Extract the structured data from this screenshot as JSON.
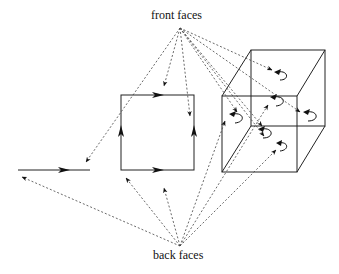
{
  "diagram": {
    "labels": {
      "front": "front faces",
      "back": "back faces"
    },
    "colors": {
      "line": "#222222",
      "dashed": "#444444",
      "background": "#ffffff"
    },
    "shapes": {
      "segment": {
        "x1": 18,
        "y1": 170,
        "x2": 90,
        "y2": 170
      },
      "square": {
        "x": 121,
        "y": 95,
        "w": 73,
        "h": 75
      },
      "cube": {
        "front": {
          "x": 222,
          "y": 96,
          "w": 75,
          "h": 76
        },
        "back": {
          "x": 251,
          "y": 50,
          "w": 74,
          "h": 76
        }
      }
    }
  }
}
